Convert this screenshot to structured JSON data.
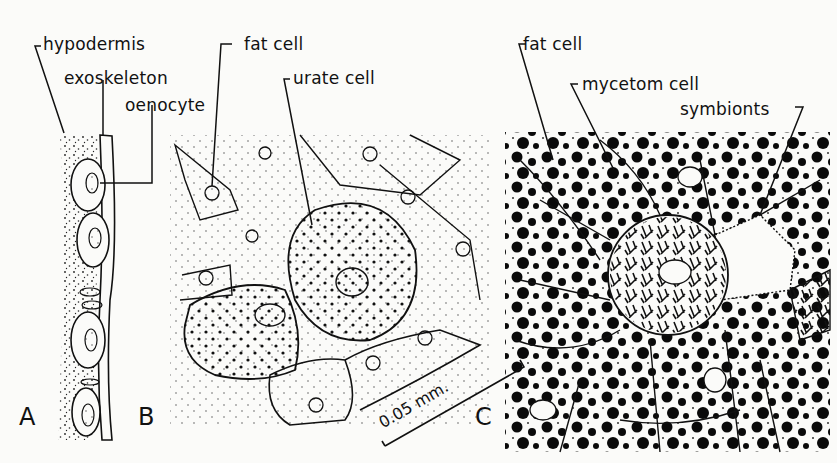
{
  "figure": {
    "panels": [
      {
        "id": "A",
        "label": "A",
        "description": "hypodermis with oenocytes beneath exoskeleton"
      },
      {
        "id": "B",
        "label": "B",
        "description": "fat body with fat cells and urate cells"
      },
      {
        "id": "C",
        "label": "C",
        "description": "fat body with mycetom cell containing symbionts"
      }
    ],
    "labels": {
      "hypodermis": "hypodermis",
      "exoskeleton": "exoskeleton",
      "oenocyte": "oenocyte",
      "fat_cell_b": "fat cell",
      "urate_cell": "urate cell",
      "fat_cell_c": "fat cell",
      "mycetom_cell": "mycetom cell",
      "symbionts": "symbionts"
    },
    "scale_bar": {
      "label": "0.05 mm."
    },
    "colors": {
      "ink": "#111111",
      "paper": "#fbfbf9"
    }
  }
}
